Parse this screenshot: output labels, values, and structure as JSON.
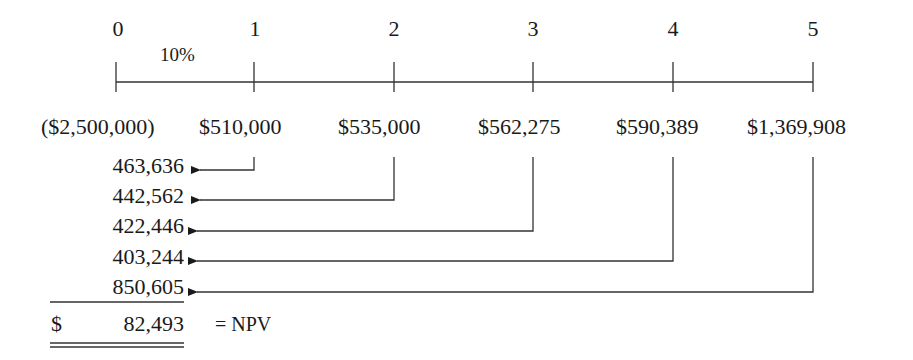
{
  "timeline": {
    "periods": [
      "0",
      "1",
      "2",
      "3",
      "4",
      "5"
    ],
    "rate_label": "10%"
  },
  "cash_flows": [
    "($2,500,000)",
    "$510,000",
    "$535,000",
    "$562,275",
    "$590,389",
    "$1,369,908"
  ],
  "present_values": [
    "463,636",
    "442,562",
    "422,446",
    "403,244",
    "850,605"
  ],
  "npv": {
    "currency": "$",
    "value": "82,493",
    "label": "= NPV"
  },
  "colors": {
    "text": "#1a1a1a",
    "lines": "#333333",
    "background": "#ffffff"
  }
}
